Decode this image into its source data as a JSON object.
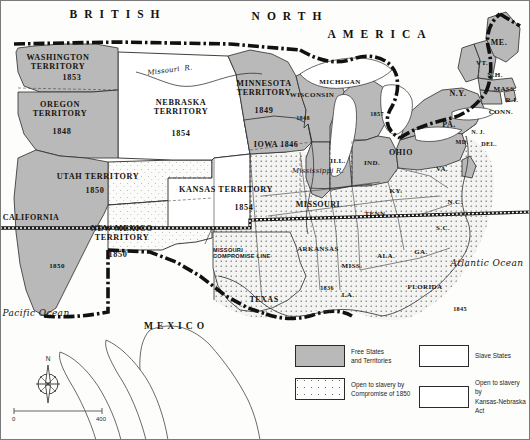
{
  "map": {
    "title": "United States 1854: Free and Slave States and Territories",
    "countries": [
      {
        "name": "british-north-america-line1",
        "text": "BRITISH"
      },
      {
        "name": "british-north-america-line2",
        "text": "NORTH"
      },
      {
        "name": "british-north-america-line3",
        "text": "AMERICA"
      },
      {
        "name": "mexico",
        "text": "MEXICO"
      }
    ],
    "oceans": [
      {
        "name": "pacific-ocean",
        "text": "Pacific Ocean"
      },
      {
        "name": "atlantic-ocean",
        "text": "Atlantic Ocean"
      }
    ],
    "rivers": [
      {
        "name": "missouri-river",
        "text": "Missouri  R."
      },
      {
        "name": "mississippi-river",
        "text": "Mississippi R."
      }
    ],
    "territories": [
      {
        "name": "washington-territory",
        "label": "WASHINGTON\nTERRITORY",
        "year": "1853",
        "fill": "free"
      },
      {
        "name": "oregon-territory",
        "label": "OREGON\nTERRITORY",
        "year": "1848",
        "fill": "free"
      },
      {
        "name": "minnesota-territory",
        "label": "MINNESOTA\nTERRITORY",
        "year": "1849",
        "fill": "free"
      },
      {
        "name": "nebraska-territory",
        "label": "NEBRASKA\nTERRITORY",
        "year": "1854",
        "fill": "kansas-nebraska"
      },
      {
        "name": "kansas-territory",
        "label": "KANSAS TERRITORY",
        "year": "1854",
        "fill": "kansas-nebraska"
      },
      {
        "name": "utah-territory",
        "label": "UTAH TERRITORY",
        "year": "1850",
        "fill": "compromise-1850"
      },
      {
        "name": "new-mexico-territory",
        "label": "NEW MEXICO\nTERRITORY",
        "year": "1850",
        "fill": "compromise-1850"
      }
    ],
    "free_states": [
      {
        "name": "california",
        "label": "CALIFORNIA",
        "year": "1850"
      },
      {
        "name": "wisconsin",
        "label": "WISCONSIN",
        "year": "1848"
      },
      {
        "name": "michigan",
        "label": "MICHIGAN",
        "year": "1857"
      },
      {
        "name": "iowa",
        "label": "IOWA 1846",
        "year": ""
      },
      {
        "name": "illinois",
        "label": "ILL.",
        "year": ""
      },
      {
        "name": "indiana",
        "label": "IND.",
        "year": ""
      },
      {
        "name": "ohio",
        "label": "OHIO",
        "year": ""
      },
      {
        "name": "pennsylvania",
        "label": "PA.",
        "year": ""
      },
      {
        "name": "new-york",
        "label": "N.Y.",
        "year": ""
      },
      {
        "name": "maine",
        "label": "ME.",
        "year": ""
      },
      {
        "name": "vermont",
        "label": "VT.",
        "year": ""
      },
      {
        "name": "new-hampshire",
        "label": "N.H.",
        "year": ""
      },
      {
        "name": "massachusetts",
        "label": "MASS.",
        "year": ""
      },
      {
        "name": "rhode-island",
        "label": "R.I.",
        "year": ""
      },
      {
        "name": "connecticut",
        "label": "CONN.",
        "year": ""
      },
      {
        "name": "new-jersey",
        "label": "N. J.",
        "year": ""
      }
    ],
    "slave_states": [
      {
        "name": "missouri",
        "label": "MISSOURI",
        "year": ""
      },
      {
        "name": "arkansas",
        "label": "ARKANSAS",
        "year": "1836"
      },
      {
        "name": "texas",
        "label": "TEXAS",
        "year": ""
      },
      {
        "name": "louisiana",
        "label": "LA.",
        "year": ""
      },
      {
        "name": "mississippi-state",
        "label": "MISS.",
        "year": ""
      },
      {
        "name": "alabama",
        "label": "ALA.",
        "year": ""
      },
      {
        "name": "georgia",
        "label": "GA.",
        "year": ""
      },
      {
        "name": "florida",
        "label": "FLORIDA",
        "year": "1845"
      },
      {
        "name": "south-carolina",
        "label": "S.C.",
        "year": ""
      },
      {
        "name": "north-carolina",
        "label": "N.C.",
        "year": ""
      },
      {
        "name": "tennessee",
        "label": "TENN.",
        "year": ""
      },
      {
        "name": "kentucky",
        "label": "KY.",
        "year": ""
      },
      {
        "name": "virginia",
        "label": "VA.",
        "year": ""
      },
      {
        "name": "maryland",
        "label": "MD.",
        "year": ""
      },
      {
        "name": "delaware",
        "label": "DEL.",
        "year": ""
      }
    ],
    "annotations": [
      {
        "name": "missouri-compromise-line",
        "text": "MISSOURI\nCOMPROMISE LINE"
      }
    ]
  },
  "legend": {
    "items": [
      {
        "name": "free-states",
        "swatch": "free",
        "text": "Free States\nand Territories"
      },
      {
        "name": "slave-states",
        "swatch": "slave",
        "text": "Slave States"
      },
      {
        "name": "open-compromise-1850",
        "swatch": "compromise",
        "text": "Open to slavery by\nCompromise of 1850"
      },
      {
        "name": "open-kansas-nebraska",
        "swatch": "kansas-nebraska",
        "text": "Open to slavery by\nKansas-Nebraska Act"
      }
    ]
  },
  "compass": {
    "north_label": "N"
  },
  "scale": {
    "min": "0",
    "max": "400"
  },
  "colors": {
    "free_fill": "#b9b9b9",
    "slave_fill": "#ffffff",
    "water": "#ffffff",
    "ink": "#16140f",
    "paper": "#fdfdfb"
  }
}
